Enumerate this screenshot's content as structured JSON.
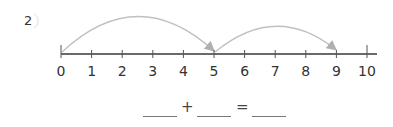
{
  "problem": {
    "number": "2",
    "icon": "circled-number"
  },
  "number_line": {
    "min": 0,
    "max": 10,
    "ticks": [
      "0",
      "1",
      "2",
      "3",
      "4",
      "5",
      "6",
      "7",
      "8",
      "9",
      "10"
    ],
    "line_color": "#666666",
    "arc_color": "#b8b8b8",
    "jumps": [
      {
        "from": 0,
        "to": 5
      },
      {
        "from": 5,
        "to": 9
      }
    ]
  },
  "equation": {
    "plus": "+",
    "equals": "=",
    "blank1": "",
    "blank2": "",
    "result": ""
  }
}
